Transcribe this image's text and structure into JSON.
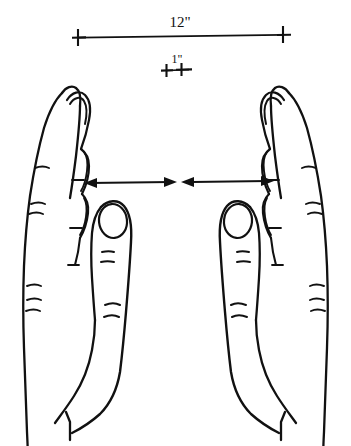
{
  "figure": {
    "background_color": "#ffffff",
    "ink_color": "#111111",
    "width": 351,
    "height": 446
  },
  "dimensions": {
    "overall": {
      "label": "12\"",
      "value": 12,
      "unit": "inch",
      "endpoint_style": "cross-tick",
      "line_y": 37,
      "x_start": 78,
      "x_end": 283,
      "label_x": 180,
      "label_y": 27
    },
    "gap": {
      "label": "1\"",
      "value": 1,
      "unit": "inch",
      "endpoint_style": "cross-tick",
      "line_y": 70,
      "x_start": 166,
      "x_end": 190,
      "label_x": 178,
      "label_y": 63
    }
  },
  "arrows": {
    "left": {
      "name": "left-span-arrow",
      "y": 182,
      "x_start": 85,
      "x_end": 176,
      "heads": "both"
    },
    "right": {
      "name": "right-span-arrow",
      "y": 182,
      "x_start": 182,
      "x_end": 272,
      "heads": "both"
    }
  },
  "hands": [
    {
      "name": "left-hand",
      "side": "left",
      "view": "side profile, fingers up",
      "parts": [
        "index-finger",
        "stacked-fingers",
        "thumb",
        "thumbnail",
        "palm-edge",
        "wrist",
        "knuckle-creases"
      ]
    },
    {
      "name": "right-hand",
      "side": "right",
      "view": "side profile, fingers up, mirrored",
      "parts": [
        "index-finger",
        "stacked-fingers",
        "thumb",
        "thumbnail",
        "palm-edge",
        "wrist",
        "knuckle-creases"
      ]
    }
  ]
}
